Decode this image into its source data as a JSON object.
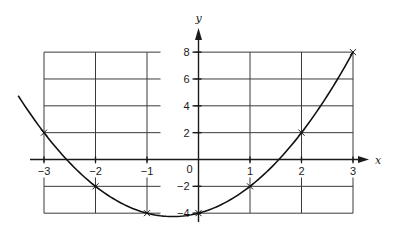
{
  "chart_data": {
    "type": "line",
    "title": "",
    "xlabel": "x",
    "ylabel": "y",
    "xlim": [
      -3,
      3
    ],
    "ylim": [
      -4,
      8
    ],
    "grid": true,
    "legend": null,
    "x_ticks": [
      -3,
      -2,
      -1,
      0,
      1,
      2,
      3
    ],
    "x_tick_labels": [
      "−3",
      "−2",
      "−1",
      "0",
      "1",
      "2",
      "3"
    ],
    "y_ticks": [
      -4,
      -2,
      2,
      4,
      6,
      8
    ],
    "y_tick_labels": [
      "−4",
      "−2",
      "2",
      "4",
      "6",
      "8"
    ],
    "origin_label": "0",
    "series": [
      {
        "name": "y = x² + x − 4",
        "x": [
          -3,
          -2,
          -1,
          0,
          1,
          2,
          3
        ],
        "y": [
          2,
          -2,
          -4,
          -4,
          -2,
          2,
          8
        ],
        "marked_points": true,
        "curve_extent_x": [
          -3.5,
          3
        ]
      }
    ],
    "colors": {
      "line": "#111111",
      "grid": "#3a3a3a"
    }
  }
}
